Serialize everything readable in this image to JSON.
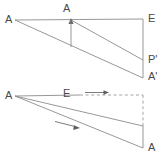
{
  "figure": {
    "background_color": "#ffffff",
    "stroke_color": "#8c8c8c",
    "label_color": "#4a4a4a",
    "width": 167,
    "height": 165,
    "diagrams": [
      {
        "id": "upper-diagram",
        "name": "upper-construction",
        "labels": [
          {
            "id": "upper-a-left",
            "text": "A",
            "x": 5,
            "y": 14
          },
          {
            "id": "upper-a-apex",
            "text": "A",
            "x": 63,
            "y": 3
          },
          {
            "id": "upper-e",
            "text": "E",
            "x": 148,
            "y": 13
          },
          {
            "id": "upper-p-prime",
            "text": "P'",
            "x": 148,
            "y": 54
          },
          {
            "id": "upper-a-prime",
            "text": "A'",
            "x": 148,
            "y": 71
          }
        ],
        "arrows": [
          {
            "id": "upper-vertical-arrow",
            "direction": "up",
            "from_x": 71,
            "from_y": 47,
            "to_x": 71,
            "to_y": 20
          }
        ]
      },
      {
        "id": "lower-diagram",
        "name": "lower-construction",
        "labels": [
          {
            "id": "lower-a-left",
            "text": "A",
            "x": 5,
            "y": 90
          },
          {
            "id": "lower-e",
            "text": "E",
            "x": 63,
            "y": 88
          },
          {
            "id": "lower-a-bottom",
            "text": "A",
            "x": 148,
            "y": 142
          }
        ],
        "arrows": [
          {
            "id": "lower-horizontal-arrow",
            "direction": "right",
            "from_x": 85,
            "from_y": 93,
            "to_x": 108,
            "to_y": 93
          },
          {
            "id": "lower-diagonal-arrow",
            "direction": "right-down",
            "from_x": 55,
            "from_y": 122,
            "to_x": 80,
            "to_y": 129
          }
        ]
      }
    ]
  }
}
